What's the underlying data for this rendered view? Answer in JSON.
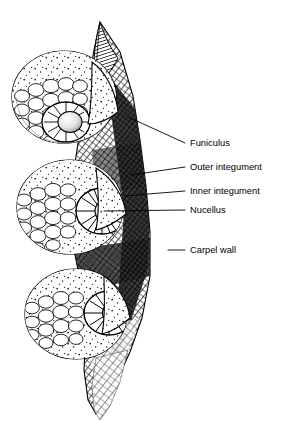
{
  "figure": {
    "background_color": "#ffffff",
    "ink_color": "#000000",
    "width": 285,
    "height": 429
  },
  "labels": [
    {
      "id": "funiculus",
      "text": "Funiculus",
      "text_x": 190,
      "text_y": 146,
      "leader": {
        "x1": 185,
        "y1": 143,
        "x2": 128,
        "y2": 117
      }
    },
    {
      "id": "outer-integument",
      "text": "Outer integument",
      "text_x": 190,
      "text_y": 170,
      "leader": {
        "x1": 185,
        "y1": 167,
        "x2": 131,
        "y2": 175
      }
    },
    {
      "id": "inner-integument",
      "text": "Inner integument",
      "text_x": 190,
      "text_y": 194,
      "leader": {
        "x1": 185,
        "y1": 191,
        "x2": 124,
        "y2": 196
      }
    },
    {
      "id": "nucellus",
      "text": "Nucellus",
      "text_x": 190,
      "text_y": 213,
      "leader": {
        "x1": 185,
        "y1": 210,
        "x2": 104,
        "y2": 211
      }
    },
    {
      "id": "carpel-wall",
      "text": "Carpel wall",
      "text_x": 190,
      "text_y": 253,
      "leader": {
        "x1": 185,
        "y1": 250,
        "x2": 168,
        "y2": 250
      }
    }
  ],
  "anatomy": {
    "ovules": [
      {
        "id": "ovule-upper",
        "cx": 64,
        "cy": 97,
        "rx": 52,
        "ry": 46,
        "micropyle_cx": 66,
        "micropyle_cy": 122
      },
      {
        "id": "ovule-middle",
        "cx": 70,
        "cy": 207,
        "rx": 53,
        "ry": 47,
        "micropyle_cx": 103,
        "micropyle_cy": 211
      },
      {
        "id": "ovule-lower",
        "cx": 76,
        "cy": 314,
        "rx": 51,
        "ry": 45,
        "micropyle_cx": 110,
        "micropyle_cy": 313
      }
    ],
    "carpel_wall": {
      "id": "carpel-wall-body",
      "top_y": 22,
      "bottom_y": 410
    },
    "apical_flap": {
      "id": "carpel-apex-flap",
      "tip_x": 100,
      "tip_y": 22
    }
  }
}
